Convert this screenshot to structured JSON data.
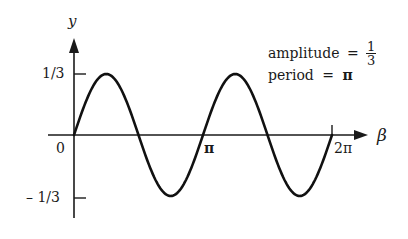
{
  "chart_data": {
    "type": "line",
    "title": "",
    "function": "y = (1/3) sin(2β)",
    "xlabel": "β",
    "ylabel": "y",
    "x_ticks": [
      "0",
      "π",
      "2π"
    ],
    "y_ticks": [
      "1/3",
      "– 1/3"
    ],
    "xlim": [
      0,
      6.2832
    ],
    "ylim": [
      -0.3333,
      0.3333
    ],
    "grid": false,
    "x": [
      0,
      0.3927,
      0.7854,
      1.1781,
      1.5708,
      1.9635,
      2.3562,
      2.7489,
      3.1416,
      3.5343,
      3.927,
      4.3197,
      4.7124,
      5.1051,
      5.4978,
      5.8905,
      6.2832
    ],
    "y": [
      0,
      0.2357,
      0.3333,
      0.2357,
      0,
      -0.2357,
      -0.3333,
      -0.2357,
      0,
      0.2357,
      0.3333,
      0.2357,
      0,
      -0.2357,
      -0.3333,
      -0.2357,
      0
    ],
    "annotations": {
      "amplitude_label": "amplitude",
      "amplitude_eq": "=",
      "amplitude_num": "1",
      "amplitude_den": "3",
      "period_label": "period",
      "period_eq": "=",
      "period_value": "π"
    }
  }
}
